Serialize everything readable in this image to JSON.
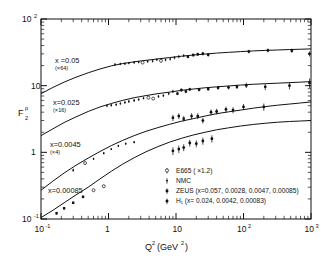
{
  "figure": {
    "y_axis_label_main": "F",
    "y_axis_label_sub": "2",
    "y_axis_label_sup": "p",
    "x_axis_label_main": "Q",
    "x_axis_label_sup": "2",
    "x_axis_label_unit": "(GeV",
    "x_axis_label_unit_sup": "2",
    "x_axis_label_unit_close": ")",
    "x_ticks": [
      "10",
      "1",
      "10",
      "10",
      "10"
    ],
    "x_tick_exponents": [
      "-1",
      "",
      "",
      "2",
      "3"
    ],
    "y_ticks": [
      "10",
      "10",
      "1",
      "10"
    ],
    "y_tick_exponents": [
      "2",
      "",
      "",
      "-1"
    ]
  },
  "annotations": [
    {
      "label": "x =0.05",
      "scale": "(×64)"
    },
    {
      "label": "x=0.025",
      "scale": "(×16)"
    },
    {
      "label": "x=0.0045",
      "scale": "(×4)"
    },
    {
      "label": "x=0.00085",
      "scale": ""
    }
  ],
  "legend": [
    {
      "marker": "open-circle-errorbar-icon",
      "text": "E665 ( ×1.2)"
    },
    {
      "marker": "small-dot-errorbar-icon",
      "text": "NMC"
    },
    {
      "marker": "filled-square-errorbar-icon",
      "text": "ZEUS (x=0.057, 0.0028, 0.0047, 0.00085)"
    },
    {
      "marker": "filled-circle-errorbar-icon",
      "text": "H₁   (x=          0.024, 0.0042, 0.00083)"
    }
  ],
  "chart_data": {
    "type": "scatter",
    "title": "",
    "xlabel": "Q2 (GeV2)",
    "ylabel": "F2p",
    "xscale": "log",
    "yscale": "log",
    "xlim": [
      0.1,
      1000
    ],
    "ylim": [
      0.1,
      100
    ],
    "grid": false,
    "legend_position": "lower-right-inside",
    "series": [
      {
        "name": "x=0.05 (x64)",
        "x_value": 0.05,
        "scale_factor": 64,
        "curve": [
          {
            "q2": 0.1,
            "f2": 7.6
          },
          {
            "q2": 0.15,
            "f2": 9.4
          },
          {
            "q2": 0.22,
            "f2": 11.3
          },
          {
            "q2": 0.33,
            "f2": 13.4
          },
          {
            "q2": 0.5,
            "f2": 15.6
          },
          {
            "q2": 0.75,
            "f2": 17.8
          },
          {
            "q2": 1.1,
            "f2": 19.8
          },
          {
            "q2": 1.6,
            "f2": 21.4
          },
          {
            "q2": 2.4,
            "f2": 22.8
          },
          {
            "q2": 3.6,
            "f2": 24.0
          },
          {
            "q2": 5.4,
            "f2": 25.2
          },
          {
            "q2": 8,
            "f2": 26.4
          },
          {
            "q2": 12,
            "f2": 27.6
          },
          {
            "q2": 18,
            "f2": 28.8
          },
          {
            "q2": 27,
            "f2": 29.8
          },
          {
            "q2": 40,
            "f2": 30.8
          },
          {
            "q2": 60,
            "f2": 31.6
          },
          {
            "q2": 90,
            "f2": 32.4
          },
          {
            "q2": 140,
            "f2": 33.2
          },
          {
            "q2": 210,
            "f2": 33.8
          },
          {
            "q2": 320,
            "f2": 34.3
          },
          {
            "q2": 480,
            "f2": 34.8
          },
          {
            "q2": 700,
            "f2": 35.2
          },
          {
            "q2": 1000,
            "f2": 35.6
          }
        ],
        "points": [
          {
            "q2": 1.25,
            "f2": 20.8,
            "err": 0.9,
            "set": "NMC"
          },
          {
            "q2": 1.5,
            "f2": 21.2,
            "err": 0.9,
            "set": "NMC"
          },
          {
            "q2": 1.75,
            "f2": 21.4,
            "err": 0.9,
            "set": "NMC"
          },
          {
            "q2": 2.0,
            "f2": 21.8,
            "err": 0.9,
            "set": "NMC"
          },
          {
            "q2": 2.4,
            "f2": 22.3,
            "err": 1.0,
            "set": "NMC"
          },
          {
            "q2": 2.8,
            "f2": 22.6,
            "err": 1.0,
            "set": "NMC"
          },
          {
            "q2": 3.2,
            "f2": 22.2,
            "err": 1.0,
            "set": "E665"
          },
          {
            "q2": 3.8,
            "f2": 23.1,
            "err": 1.1,
            "set": "NMC"
          },
          {
            "q2": 4.5,
            "f2": 23.4,
            "err": 1.1,
            "set": "NMC"
          },
          {
            "q2": 5.2,
            "f2": 24.6,
            "err": 1.2,
            "set": "NMC"
          },
          {
            "q2": 6.0,
            "f2": 23.6,
            "err": 1.1,
            "set": "E665"
          },
          {
            "q2": 7.0,
            "f2": 24.4,
            "err": 1.2,
            "set": "NMC"
          },
          {
            "q2": 8.2,
            "f2": 25.1,
            "err": 1.3,
            "set": "NMC"
          },
          {
            "q2": 9.5,
            "f2": 26.3,
            "err": 1.4,
            "set": "NMC"
          },
          {
            "q2": 11,
            "f2": 27.3,
            "err": 1.5,
            "set": "NMC"
          },
          {
            "q2": 13,
            "f2": 28.3,
            "err": 1.5,
            "set": "NMC"
          },
          {
            "q2": 15,
            "f2": 27.2,
            "err": 1.5,
            "set": "ZEUS"
          },
          {
            "q2": 18,
            "f2": 28.8,
            "err": 1.6,
            "set": "ZEUS"
          },
          {
            "q2": 21,
            "f2": 29.6,
            "err": 1.7,
            "set": "ZEUS"
          },
          {
            "q2": 25,
            "f2": 30.2,
            "err": 1.8,
            "set": "H1"
          },
          {
            "q2": 30,
            "f2": 29.0,
            "err": 1.7,
            "set": "H1"
          },
          {
            "q2": 120,
            "f2": 32.5,
            "err": 2.0,
            "set": "H1"
          },
          {
            "q2": 230,
            "f2": 33.8,
            "err": 2.2,
            "set": "H1"
          },
          {
            "q2": 520,
            "f2": 33.5,
            "err": 2.4,
            "set": "H1"
          },
          {
            "q2": 950,
            "f2": 30.0,
            "err": 2.6,
            "set": "H1"
          }
        ]
      },
      {
        "name": "x=0.025 (x16)",
        "x_value": 0.025,
        "scale_factor": 16,
        "curve": [
          {
            "q2": 0.1,
            "f2": 1.78
          },
          {
            "q2": 0.15,
            "f2": 2.25
          },
          {
            "q2": 0.22,
            "f2": 2.8
          },
          {
            "q2": 0.33,
            "f2": 3.4
          },
          {
            "q2": 0.5,
            "f2": 4.1
          },
          {
            "q2": 0.75,
            "f2": 4.8
          },
          {
            "q2": 1.1,
            "f2": 5.4
          },
          {
            "q2": 1.6,
            "f2": 6.0
          },
          {
            "q2": 2.4,
            "f2": 6.6
          },
          {
            "q2": 3.6,
            "f2": 7.1
          },
          {
            "q2": 5.4,
            "f2": 7.6
          },
          {
            "q2": 8,
            "f2": 8.0
          },
          {
            "q2": 12,
            "f2": 8.5
          },
          {
            "q2": 18,
            "f2": 8.9
          },
          {
            "q2": 27,
            "f2": 9.3
          },
          {
            "q2": 40,
            "f2": 9.6
          },
          {
            "q2": 60,
            "f2": 9.9
          },
          {
            "q2": 90,
            "f2": 10.2
          },
          {
            "q2": 140,
            "f2": 10.5
          },
          {
            "q2": 210,
            "f2": 10.7
          },
          {
            "q2": 320,
            "f2": 10.9
          },
          {
            "q2": 480,
            "f2": 11.1
          },
          {
            "q2": 700,
            "f2": 11.3
          },
          {
            "q2": 1000,
            "f2": 11.5
          }
        ],
        "points": [
          {
            "q2": 0.95,
            "f2": 5.0,
            "err": 0.25,
            "set": "NMC"
          },
          {
            "q2": 1.1,
            "f2": 5.1,
            "err": 0.25,
            "set": "NMC"
          },
          {
            "q2": 1.3,
            "f2": 5.2,
            "err": 0.25,
            "set": "NMC"
          },
          {
            "q2": 1.5,
            "f2": 5.4,
            "err": 0.25,
            "set": "NMC"
          },
          {
            "q2": 1.75,
            "f2": 5.6,
            "err": 0.25,
            "set": "NMC"
          },
          {
            "q2": 2.0,
            "f2": 5.8,
            "err": 0.3,
            "set": "NMC"
          },
          {
            "q2": 2.4,
            "f2": 6.0,
            "err": 0.3,
            "set": "NMC"
          },
          {
            "q2": 2.8,
            "f2": 6.2,
            "err": 0.3,
            "set": "NMC"
          },
          {
            "q2": 3.3,
            "f2": 6.5,
            "err": 0.3,
            "set": "NMC"
          },
          {
            "q2": 3.9,
            "f2": 6.6,
            "err": 0.3,
            "set": "E665"
          },
          {
            "q2": 4.6,
            "f2": 6.4,
            "err": 0.3,
            "set": "E665"
          },
          {
            "q2": 5.5,
            "f2": 6.9,
            "err": 0.35,
            "set": "NMC"
          },
          {
            "q2": 6.5,
            "f2": 7.1,
            "err": 0.35,
            "set": "NMC"
          },
          {
            "q2": 7.8,
            "f2": 7.6,
            "err": 0.4,
            "set": "NMC"
          },
          {
            "q2": 9.0,
            "f2": 8.2,
            "err": 0.45,
            "set": "NMC"
          },
          {
            "q2": 10.5,
            "f2": 7.6,
            "err": 0.4,
            "set": "ZEUS"
          },
          {
            "q2": 12,
            "f2": 8.6,
            "err": 0.5,
            "set": "ZEUS"
          },
          {
            "q2": 14,
            "f2": 8.2,
            "err": 0.5,
            "set": "ZEUS"
          },
          {
            "q2": 16,
            "f2": 8.8,
            "err": 0.5,
            "set": "H1"
          },
          {
            "q2": 22,
            "f2": 8.7,
            "err": 0.5,
            "set": "H1"
          },
          {
            "q2": 30,
            "f2": 8.9,
            "err": 0.5,
            "set": "H1"
          },
          {
            "q2": 42,
            "f2": 9.3,
            "err": 0.6,
            "set": "H1"
          },
          {
            "q2": 60,
            "f2": 9.4,
            "err": 0.6,
            "set": "H1"
          },
          {
            "q2": 80,
            "f2": 9.6,
            "err": 0.7,
            "set": "H1"
          },
          {
            "q2": 110,
            "f2": 10.1,
            "err": 0.9,
            "set": "H1"
          },
          {
            "q2": 210,
            "f2": 9.6,
            "err": 1.0,
            "set": "H1"
          },
          {
            "q2": 480,
            "f2": 10.0,
            "err": 1.2,
            "set": "H1"
          },
          {
            "q2": 950,
            "f2": 11.0,
            "err": 1.8,
            "set": "H1"
          }
        ]
      },
      {
        "name": "x=0.0045 (x4)",
        "x_value": 0.0045,
        "scale_factor": 4,
        "curve": [
          {
            "q2": 0.1,
            "f2": 0.27
          },
          {
            "q2": 0.15,
            "f2": 0.37
          },
          {
            "q2": 0.22,
            "f2": 0.49
          },
          {
            "q2": 0.33,
            "f2": 0.64
          },
          {
            "q2": 0.5,
            "f2": 0.82
          },
          {
            "q2": 0.75,
            "f2": 1.03
          },
          {
            "q2": 1.1,
            "f2": 1.26
          },
          {
            "q2": 1.6,
            "f2": 1.5
          },
          {
            "q2": 2.4,
            "f2": 1.78
          },
          {
            "q2": 3.6,
            "f2": 2.07
          },
          {
            "q2": 5.4,
            "f2": 2.35
          },
          {
            "q2": 8,
            "f2": 2.63
          },
          {
            "q2": 12,
            "f2": 2.93
          },
          {
            "q2": 18,
            "f2": 3.2
          },
          {
            "q2": 27,
            "f2": 3.5
          },
          {
            "q2": 40,
            "f2": 3.8
          },
          {
            "q2": 60,
            "f2": 4.05
          },
          {
            "q2": 90,
            "f2": 4.3
          },
          {
            "q2": 140,
            "f2": 4.6
          },
          {
            "q2": 210,
            "f2": 4.85
          },
          {
            "q2": 320,
            "f2": 5.1
          },
          {
            "q2": 480,
            "f2": 5.3
          },
          {
            "q2": 700,
            "f2": 5.5
          },
          {
            "q2": 1000,
            "f2": 5.7
          }
        ],
        "points": [
          {
            "q2": 0.3,
            "f2": 0.54,
            "err": 0.03,
            "set": "NMC"
          },
          {
            "q2": 0.45,
            "f2": 0.69,
            "err": 0.03,
            "set": "E665"
          },
          {
            "q2": 0.6,
            "f2": 0.8,
            "err": 0.03,
            "set": "NMC"
          },
          {
            "q2": 0.85,
            "f2": 0.97,
            "err": 0.04,
            "set": "NMC"
          },
          {
            "q2": 1.1,
            "f2": 1.12,
            "err": 0.04,
            "set": "NMC"
          },
          {
            "q2": 1.4,
            "f2": 1.25,
            "err": 0.05,
            "set": "NMC"
          },
          {
            "q2": 1.8,
            "f2": 1.35,
            "err": 0.05,
            "set": "NMC"
          },
          {
            "q2": 2.4,
            "f2": 1.42,
            "err": 0.06,
            "set": "NMC"
          },
          {
            "q2": 9.0,
            "f2": 3.3,
            "err": 0.35,
            "set": "ZEUS"
          },
          {
            "q2": 11,
            "f2": 3.5,
            "err": 0.35,
            "set": "ZEUS"
          },
          {
            "q2": 13,
            "f2": 3.2,
            "err": 0.3,
            "set": "ZEUS"
          },
          {
            "q2": 17,
            "f2": 3.5,
            "err": 0.35,
            "set": "ZEUS"
          },
          {
            "q2": 21,
            "f2": 3.5,
            "err": 0.35,
            "set": "H1"
          },
          {
            "q2": 25,
            "f2": 3.0,
            "err": 0.3,
            "set": "H1"
          },
          {
            "q2": 33,
            "f2": 4.0,
            "err": 0.4,
            "set": "H1"
          },
          {
            "q2": 40,
            "f2": 4.1,
            "err": 0.4,
            "set": "H1"
          },
          {
            "q2": 55,
            "f2": 4.4,
            "err": 0.45,
            "set": "H1"
          },
          {
            "q2": 70,
            "f2": 4.3,
            "err": 0.45,
            "set": "H1"
          },
          {
            "q2": 100,
            "f2": 4.8,
            "err": 0.5,
            "set": "H1"
          },
          {
            "q2": 200,
            "f2": 4.8,
            "err": 0.6,
            "set": "H1"
          }
        ]
      },
      {
        "name": "x=0.00085",
        "x_value": 0.00085,
        "scale_factor": 1,
        "curve": [
          {
            "q2": 0.1,
            "f2": 0.105
          },
          {
            "q2": 0.15,
            "f2": 0.135
          },
          {
            "q2": 0.22,
            "f2": 0.175
          },
          {
            "q2": 0.33,
            "f2": 0.23
          },
          {
            "q2": 0.5,
            "f2": 0.3
          },
          {
            "q2": 0.75,
            "f2": 0.4
          },
          {
            "q2": 1.1,
            "f2": 0.52
          },
          {
            "q2": 1.6,
            "f2": 0.66
          },
          {
            "q2": 2.4,
            "f2": 0.83
          },
          {
            "q2": 3.6,
            "f2": 1.02
          },
          {
            "q2": 5.4,
            "f2": 1.22
          },
          {
            "q2": 8,
            "f2": 1.42
          },
          {
            "q2": 12,
            "f2": 1.62
          },
          {
            "q2": 18,
            "f2": 1.82
          },
          {
            "q2": 27,
            "f2": 2.0
          },
          {
            "q2": 40,
            "f2": 2.18
          },
          {
            "q2": 60,
            "f2": 2.33
          },
          {
            "q2": 90,
            "f2": 2.48
          },
          {
            "q2": 140,
            "f2": 2.62
          },
          {
            "q2": 210,
            "f2": 2.73
          },
          {
            "q2": 320,
            "f2": 2.83
          },
          {
            "q2": 480,
            "f2": 2.9
          },
          {
            "q2": 700,
            "f2": 2.95
          },
          {
            "q2": 1000,
            "f2": 3.0
          }
        ],
        "points": [
          {
            "q2": 0.17,
            "f2": 0.122,
            "err": 0.006,
            "set": "ZEUS"
          },
          {
            "q2": 0.22,
            "f2": 0.145,
            "err": 0.007,
            "set": "ZEUS"
          },
          {
            "q2": 0.3,
            "f2": 0.175,
            "err": 0.008,
            "set": "ZEUS"
          },
          {
            "q2": 0.42,
            "f2": 0.215,
            "err": 0.01,
            "set": "ZEUS"
          },
          {
            "q2": 0.6,
            "f2": 0.27,
            "err": 0.012,
            "set": "E665"
          },
          {
            "q2": 0.85,
            "f2": 0.31,
            "err": 0.015,
            "set": "E665"
          },
          {
            "q2": 9.0,
            "f2": 1.05,
            "err": 0.14,
            "set": "ZEUS"
          },
          {
            "q2": 11,
            "f2": 1.12,
            "err": 0.14,
            "set": "ZEUS"
          },
          {
            "q2": 13,
            "f2": 1.18,
            "err": 0.14,
            "set": "H1"
          },
          {
            "q2": 16,
            "f2": 1.38,
            "err": 0.16,
            "set": "H1"
          },
          {
            "q2": 20,
            "f2": 1.35,
            "err": 0.16,
            "set": "H1"
          },
          {
            "q2": 25,
            "f2": 1.48,
            "err": 0.18,
            "set": "H1"
          },
          {
            "q2": 34,
            "f2": 1.6,
            "err": 0.2,
            "set": "H1"
          }
        ]
      }
    ]
  }
}
